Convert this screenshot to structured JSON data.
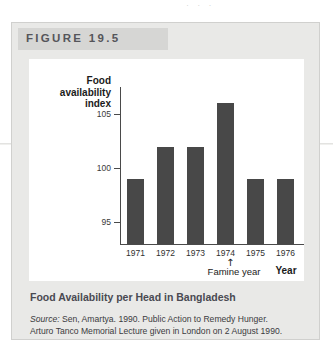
{
  "figure": {
    "header_label": "FIGURE 19.5",
    "caption": "Food Availability per Head in Bangladesh",
    "source_keyword": "Source:",
    "source_line1": " Sen, Amartya. 1990. Public Action to Remedy Hunger.",
    "source_line2": "Arturo Tanco Memorial Lecture given in London on 2 August 1990.",
    "page_bleed_text": "· · ·"
  },
  "chart_data": {
    "type": "bar",
    "title": "Food Availability per Head in Bangladesh",
    "categories": [
      "1971",
      "1972",
      "1973",
      "1974",
      "1975",
      "1976"
    ],
    "values": [
      99,
      102,
      102,
      106,
      99,
      99
    ],
    "xlabel": "Year",
    "ylabel": "Food availability index",
    "ylabel_lines": [
      "Food",
      "availability",
      "index"
    ],
    "yticks": [
      95,
      100,
      105
    ],
    "ytick_labels": [
      "95",
      "100",
      "105"
    ],
    "ylim": [
      93,
      107.5
    ],
    "grid": false,
    "legend": false,
    "bar_color": "#484848",
    "annotations": [
      {
        "text": "Famine year",
        "arrow": "↑",
        "target_category": "1974"
      }
    ]
  },
  "colors": {
    "panel_bg": "#e9e9e7",
    "header_bg": "#d6d6d4",
    "plot_bg": "#ffffff",
    "bar": "#484848",
    "axis": "#4a4a4a",
    "caption_text": "#4a4a52"
  }
}
